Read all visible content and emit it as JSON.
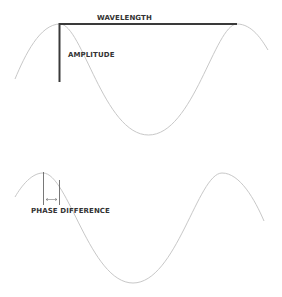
{
  "diagram": {
    "labels": {
      "wavelength": "WAVELENGTH",
      "amplitude": "AMPLITUDE",
      "phase_difference": "PHASE DIFFERENCE"
    },
    "colors": {
      "wave": "#c8c8c8",
      "marker": "#3a3a3a",
      "text": "#333333",
      "background": "#ffffff"
    },
    "waves": [
      {
        "name": "reference-wave",
        "peak_y": 24,
        "trough_y": 135,
        "peak_x": [
          60,
          237
        ]
      },
      {
        "name": "shifted-wave",
        "peak_y": 173,
        "trough_y": 283,
        "peak_x": [
          43,
          222
        ]
      }
    ]
  }
}
